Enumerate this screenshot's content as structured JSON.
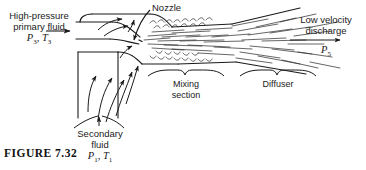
{
  "figure": {
    "caption": "FIGURE  7.32",
    "background_color": "#ffffff",
    "line_color": "#1a1a1a"
  },
  "labels": {
    "primary_inlet": {
      "line1": "High-pressure",
      "line2": "primary fluid",
      "symbols": "P3, T3",
      "pressure_symbol": "P",
      "pressure_sub": "3",
      "temperature_symbol": "T",
      "temperature_sub": "3"
    },
    "nozzle": {
      "text": "Nozzle"
    },
    "discharge": {
      "line1": "Low velocity",
      "line2": "discharge",
      "pressure_symbol": "P",
      "pressure_sub": "5"
    },
    "secondary_inlet": {
      "line1": "Secondary",
      "line2": "fluid",
      "pressure_symbol": "P",
      "pressure_sub": "1",
      "temperature_symbol": "T",
      "temperature_sub": "1"
    },
    "mixing_section": {
      "line1": "Mixing",
      "line2": "section"
    },
    "diffuser": {
      "line1": "Diffuser"
    }
  },
  "diagram_elements": [
    "primary-nozzle-duct",
    "secondary-fluid-duct",
    "mixing-section-duct",
    "diffuser-duct",
    "turbulent-jet-streaks",
    "flow-arrows",
    "leader-line"
  ]
}
